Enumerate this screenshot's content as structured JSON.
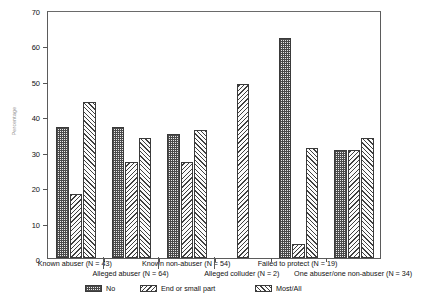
{
  "figure": {
    "top_title_fragment": "",
    "ylabel": "Percentage"
  },
  "chart_data": {
    "type": "bar",
    "title": "",
    "xlabel": "",
    "ylabel": "Percentage",
    "ylim": [
      0,
      70
    ],
    "yticks": [
      0,
      10,
      20,
      30,
      40,
      50,
      60,
      70
    ],
    "grid": false,
    "legend_position": "bottom",
    "categories": [
      "Known abuser (N = 43)",
      "Alleged abuser (N = 64)",
      "Known non-abuser (N = 54)",
      "Alleged colluder (N = 2)",
      "Failed to protect (N = 19)",
      "One abuser/one non-abuser (N = 34)"
    ],
    "series": [
      {
        "name": "No",
        "values": [
          37,
          37,
          35,
          null,
          62,
          30.5
        ]
      },
      {
        "name": "End or small part",
        "values": [
          18,
          27,
          27,
          49,
          4,
          30.5
        ]
      },
      {
        "name": "Most/All",
        "values": [
          44,
          34,
          36,
          null,
          31,
          34
        ]
      }
    ]
  },
  "legend": {
    "items": [
      {
        "label": "No",
        "pattern": "checkerboard"
      },
      {
        "label": "End or small part",
        "pattern": "back-hatch"
      },
      {
        "label": "Most/All",
        "pattern": "forward-hatch"
      }
    ]
  },
  "xaxis": {
    "row1": [
      "Known abuser (N = 43)",
      "Known non-abuser (N = 54)",
      "Failed to protect (N = 19)"
    ],
    "row2": [
      "Alleged abuser (N = 64)",
      "Alleged colluder (N = 2)",
      "One abuser/one non-abuser (N = 34)"
    ]
  }
}
